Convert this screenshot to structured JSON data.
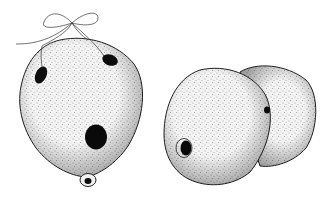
{
  "illustration": {
    "style": "stippled pen-and-ink",
    "background": "#ffffff",
    "ink": "#111111",
    "objects": [
      {
        "name": "gourd-ocarina-front",
        "features": [
          "string-bow",
          "two-finger-holes-top",
          "large-center-hole",
          "mouthpiece-nub-bottom"
        ]
      },
      {
        "name": "double-gourd-ocarina",
        "features": [
          "two-lobes",
          "side-hole-left-lobe",
          "small-hole-between-lobes"
        ]
      }
    ]
  }
}
